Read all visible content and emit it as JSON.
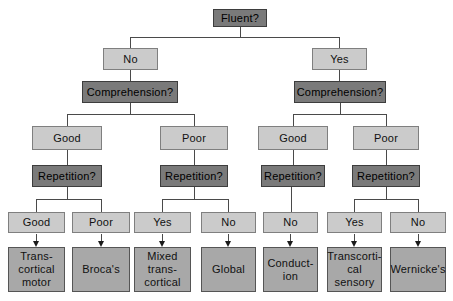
{
  "nodes": {
    "fluent": "Fluent?",
    "fluent_no": "No",
    "fluent_yes": "Yes",
    "comprehension_left": "Comprehension?",
    "comprehension_right": "Comprehension?",
    "comp_left_good": "Good",
    "comp_left_poor": "Poor",
    "comp_right_good": "Good",
    "comp_right_poor": "Poor",
    "repetition_1": "Repetition?",
    "repetition_2": "Repetition?",
    "repetition_3": "Repetition?",
    "repetition_4": "Repetition?",
    "rep1_good": "Good",
    "rep1_poor": "Poor",
    "rep2_yes": "Yes",
    "rep2_no": "No",
    "rep3_no": "No",
    "rep4_yes": "Yes",
    "rep4_no": "No",
    "dx_transcortical_motor": "Trans-\ncortical\nmotor",
    "dx_brocas": "Broca's",
    "dx_mixed_transcortical": "Mixed\ntrans-\ncortical",
    "dx_global": "Global",
    "dx_conduction": "Conduct-\nion",
    "dx_transcortical_sensory": "Transcorti-\ncal\nsensory",
    "dx_wernickes": "Wernicke's"
  },
  "colors": {
    "question_bg": "#7a7a7a",
    "question_border": "#3d3d3d",
    "answer_bg": "#cbcbcb",
    "answer_border": "#7f7f7f",
    "result_bg": "#a8a8a8",
    "result_border": "#555555",
    "line": "#4a4a4a",
    "text": "#111111",
    "page_bg": "#ffffff"
  }
}
